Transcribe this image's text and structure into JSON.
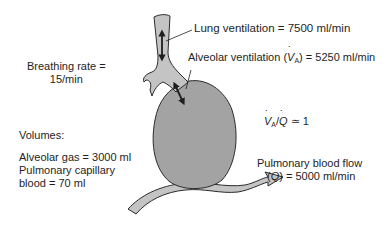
{
  "diagram": {
    "colors": {
      "organ_fill": "#a3a3a3",
      "vessel_fill": "#c4c4c4",
      "outline": "#2b2b2b",
      "text": "#1e1e1e"
    },
    "labels": {
      "breathing_rate_line1": "Breathing rate =",
      "breathing_rate_line2": "15/min",
      "lung_ventilation": "Lung ventilation = 7500 ml/min",
      "alveolar_ventilation_prefix": "Alveolar ventilation (",
      "alveolar_ventilation_symbol": "V",
      "alveolar_ventilation_sub": "A",
      "alveolar_ventilation_suffix": ") = 5250 ml/min",
      "ratio_v": "V",
      "ratio_sub": "A",
      "ratio_q": "Q",
      "ratio_suffix": " ≃ 1",
      "volumes_heading": "Volumes:",
      "alveolar_gas": "Alveolar gas = 3000 ml",
      "capillary_line1": "Pulmonary capillary",
      "capillary_line2": "blood = 70 ml",
      "blood_flow_line1": "Pulmonary blood flow",
      "blood_flow_q": "Q",
      "blood_flow_suffix": ") = 5000 ml/min"
    }
  }
}
